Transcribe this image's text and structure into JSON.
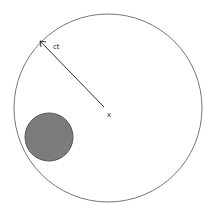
{
  "diagram": {
    "outer_circle": {
      "cx": 108,
      "cy": 108,
      "r": 94,
      "stroke": "#777777"
    },
    "radius_line": {
      "x1": 40,
      "y1": 41,
      "x2": 104,
      "y2": 107,
      "stroke": "#333333"
    },
    "radius_label": "ct",
    "center_label": "x",
    "inner_disk": {
      "cx": 49,
      "cy": 137,
      "r": 24,
      "fill": "#7c7c7c",
      "stroke": "#555555"
    }
  }
}
